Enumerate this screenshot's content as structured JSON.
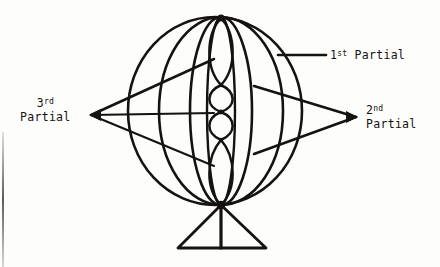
{
  "figure": {
    "ink_color": "#15130f",
    "background_color": "#fdfdfc",
    "labels": [
      {
        "id": "first-partial",
        "ordinal": "1",
        "ordinal_suffix": "st",
        "text": "Partial",
        "full_text": "1st Partial",
        "position": "right-upper",
        "leader": "horizontal line pointing left into sphere"
      },
      {
        "id": "second-partial",
        "ordinal": "2",
        "ordinal_suffix": "nd",
        "text": "Partial",
        "full_text": "2nd Partial",
        "position": "right-middle",
        "leader": "two lines converging to an arrow point at right"
      },
      {
        "id": "third-partial",
        "ordinal": "3",
        "ordinal_suffix": "rd",
        "text": "Partial",
        "full_text": "3rd Partial",
        "position": "left-middle",
        "leader": "three lines converging to an arrow point at left"
      }
    ],
    "elements": {
      "outer_circle": "sphere outline",
      "longitude_ellipses": 3,
      "central_lens_nodes": 4,
      "base": "triangular stand with vertical post"
    }
  }
}
